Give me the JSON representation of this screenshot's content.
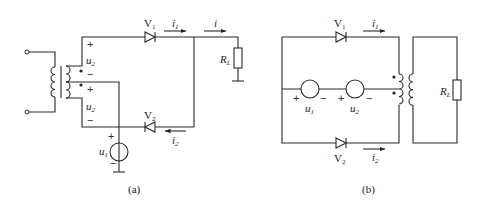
{
  "figure_a": {
    "caption": "(a)",
    "labels": {
      "V1": "V",
      "V1_sub": "1",
      "V2": "V",
      "V2_sub": "2",
      "i1": "i",
      "i1_sub": "1",
      "i2": "i",
      "i2_sub": "2",
      "i": "i",
      "RL": "R",
      "RL_sub": "L",
      "u2_top": "u",
      "u2_top_sub": "2",
      "u2_bot": "u",
      "u2_bot_sub": "2",
      "u1": "u",
      "u1_sub": "1",
      "plus": "+",
      "minus": "−"
    }
  },
  "figure_b": {
    "caption": "(b)",
    "labels": {
      "V1": "V",
      "V1_sub": "1",
      "V2": "V",
      "V2_sub": "2",
      "i1": "i",
      "i1_sub": "1",
      "i2": "i",
      "i2_sub": "2",
      "RL": "R",
      "RL_sub": "L",
      "u1": "u",
      "u1_sub": "1",
      "u2": "u",
      "u2_sub": "2",
      "plus": "+",
      "minus": "−"
    }
  }
}
